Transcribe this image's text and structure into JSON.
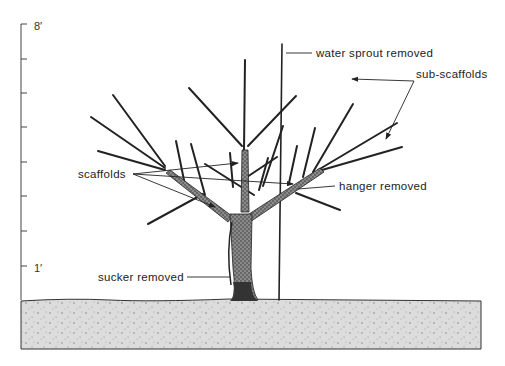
{
  "diagram": {
    "scale": {
      "top_label": "8′",
      "bottom_label": "1′",
      "ticks": 8
    },
    "labels": {
      "water_sprout": "water sprout removed",
      "sub_scaffolds": "sub-scaffolds",
      "scaffolds": "scaffolds",
      "hanger": "hanger removed",
      "sucker": "sucker removed"
    },
    "colors": {
      "ink": "#222222",
      "trunk_fill": "#6f6f6f",
      "ground_fill": "#d9d9d9",
      "background": "#ffffff"
    }
  }
}
